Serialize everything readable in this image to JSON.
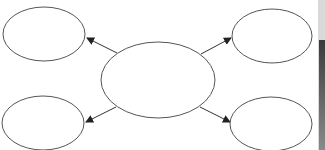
{
  "diagram": {
    "type": "hub-and-spoke",
    "stroke_color": "#555555",
    "arrow_color": "#333333",
    "background": "#ffffff",
    "nodes": [
      {
        "id": "center",
        "label": "",
        "cx": 158,
        "cy": 80,
        "rx": 57,
        "ry": 38
      },
      {
        "id": "top-left",
        "label": "",
        "cx": 44,
        "cy": 34,
        "rx": 41,
        "ry": 27
      },
      {
        "id": "top-right",
        "label": "",
        "cx": 272,
        "cy": 36,
        "rx": 40,
        "ry": 27
      },
      {
        "id": "bottom-left",
        "label": "",
        "cx": 43,
        "cy": 123,
        "rx": 41,
        "ry": 27
      },
      {
        "id": "bottom-right",
        "label": "",
        "cx": 271,
        "cy": 124,
        "rx": 41,
        "ry": 27
      }
    ],
    "edges": [
      {
        "from": "center",
        "to": "top-left"
      },
      {
        "from": "center",
        "to": "top-right"
      },
      {
        "from": "center",
        "to": "bottom-left"
      },
      {
        "from": "center",
        "to": "bottom-right"
      }
    ]
  }
}
